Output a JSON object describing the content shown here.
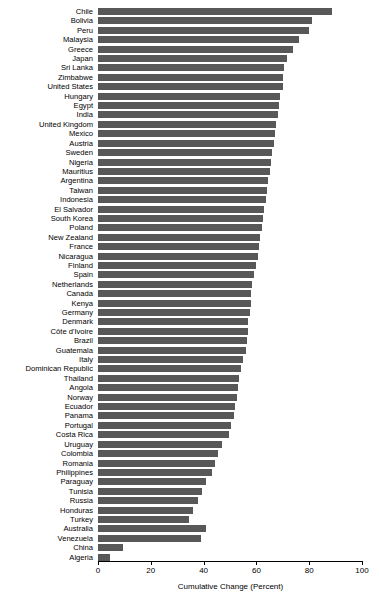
{
  "chart_data": {
    "type": "bar",
    "orientation": "horizontal",
    "title": "",
    "xlabel": "Cumulative Change (Percent)",
    "ylabel": "",
    "xlim": [
      0,
      100
    ],
    "xticks": [
      0,
      20,
      40,
      60,
      80,
      100
    ],
    "xticklabels": [
      "0",
      "20",
      "40",
      "60",
      "80",
      "100"
    ],
    "grid": false,
    "legend": false,
    "bar_color": "#585858",
    "categories": [
      "Chile",
      "Bolivia",
      "Peru",
      "Malaysia",
      "Greece",
      "Japan",
      "Sri Lanka",
      "Zimbabwe",
      "United States",
      "Hungary",
      "Egypt",
      "India",
      "United Kingdom",
      "Mexico",
      "Austria",
      "Sweden",
      "Nigeria",
      "Mauritius",
      "Argentina",
      "Taiwan",
      "Indonesia",
      "El Salvador",
      "South Korea",
      "Poland",
      "New Zealand",
      "France",
      "Nicaragua",
      "Finland",
      "Spain",
      "Netherlands",
      "Canada",
      "Kenya",
      "Germany",
      "Denmark",
      "Côte d'Ivoire",
      "Brazil",
      "Guatemala",
      "Italy",
      "Dominican Republic",
      "Thailand",
      "Angola",
      "Norway",
      "Ecuador",
      "Panama",
      "Portugal",
      "Costa Rica",
      "Uruguay",
      "Colombia",
      "Romania",
      "Philippines",
      "Paraguay",
      "Tunisia",
      "Russia",
      "Honduras",
      "Turkey",
      "Australia",
      "Venezuela",
      "China",
      "Algeria"
    ],
    "values": [
      88.5,
      81.0,
      80.0,
      76.0,
      74.0,
      71.5,
      70.5,
      70.0,
      70.0,
      69.0,
      68.5,
      68.0,
      67.5,
      67.0,
      66.5,
      66.0,
      65.5,
      65.0,
      64.5,
      64.0,
      63.5,
      63.0,
      62.5,
      62.0,
      61.5,
      61.0,
      60.5,
      60.0,
      59.0,
      58.5,
      58.0,
      58.0,
      57.5,
      57.0,
      57.0,
      56.5,
      56.0,
      55.0,
      54.0,
      53.5,
      53.0,
      52.5,
      52.0,
      51.5,
      50.5,
      49.5,
      47.0,
      45.5,
      44.5,
      43.0,
      41.0,
      39.5,
      38.0,
      36.0,
      34.5,
      41.0,
      39.0,
      9.5,
      4.5
    ]
  }
}
